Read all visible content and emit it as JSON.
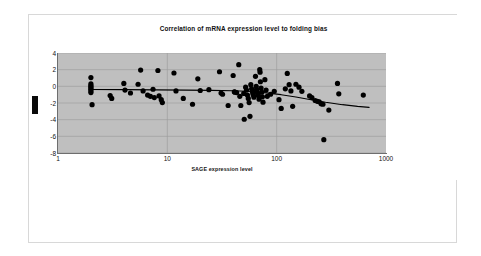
{
  "document": {
    "background_color": "#ffffff",
    "frame_color": "#d8d8d8"
  },
  "chart_data": {
    "type": "scatter",
    "title": "Correlation of mRNA expression level to folding bias",
    "xlabel": "SAGE expression level",
    "ylabel": "",
    "xscale": "log",
    "yscale": "linear",
    "xlim": [
      1,
      1000
    ],
    "ylim": [
      -8,
      4
    ],
    "xticks": [
      1,
      10,
      100,
      1000
    ],
    "xtick_labels": [
      "1",
      "10",
      "100",
      "1000"
    ],
    "yticks": [
      4,
      2,
      0,
      -2,
      -4,
      -6,
      -8
    ],
    "ytick_labels": [
      "4",
      "2",
      "0",
      "-2",
      "-4",
      "-6",
      "-8"
    ],
    "grid": true,
    "grid_color": "#9a9a9a",
    "plot_background": "#bfbfbf",
    "legend": null,
    "marker_color": "#000000",
    "marker_size": 2.6,
    "series": [
      {
        "name": "genes",
        "type": "scatter",
        "points": [
          [
            2.0,
            1.05
          ],
          [
            2.0,
            0.3
          ],
          [
            2.0,
            0.1
          ],
          [
            2.0,
            -0.05
          ],
          [
            2.0,
            -0.2
          ],
          [
            2.0,
            -0.35
          ],
          [
            2.0,
            -0.55
          ],
          [
            2.0,
            -0.75
          ],
          [
            2.05,
            -2.2
          ],
          [
            3.0,
            -1.1
          ],
          [
            3.1,
            -1.45
          ],
          [
            4.0,
            0.35
          ],
          [
            4.1,
            -0.45
          ],
          [
            4.6,
            -0.8
          ],
          [
            5.4,
            0.25
          ],
          [
            5.7,
            1.95
          ],
          [
            6.0,
            -0.55
          ],
          [
            6.6,
            -1.05
          ],
          [
            7.0,
            -1.2
          ],
          [
            7.4,
            -0.35
          ],
          [
            7.6,
            -1.35
          ],
          [
            8.2,
            1.9
          ],
          [
            8.4,
            -1.15
          ],
          [
            8.8,
            -1.6
          ],
          [
            9.0,
            -1.95
          ],
          [
            11.5,
            1.6
          ],
          [
            12.0,
            -0.55
          ],
          [
            14.0,
            -1.45
          ],
          [
            17.0,
            -2.15
          ],
          [
            19.0,
            0.9
          ],
          [
            20.0,
            -0.5
          ],
          [
            24.0,
            -0.4
          ],
          [
            30.0,
            1.75
          ],
          [
            31.0,
            -0.8
          ],
          [
            32.0,
            -0.95
          ],
          [
            36.0,
            -2.3
          ],
          [
            40.0,
            1.3
          ],
          [
            41.0,
            -0.65
          ],
          [
            41.5,
            -0.7
          ],
          [
            43.0,
            -0.75
          ],
          [
            45.0,
            2.6
          ],
          [
            46.0,
            -1.2
          ],
          [
            47.0,
            -2.3
          ],
          [
            50.0,
            -0.85
          ],
          [
            50.5,
            -3.95
          ],
          [
            52.0,
            -0.1
          ],
          [
            53.0,
            -0.45
          ],
          [
            54.0,
            -1.05
          ],
          [
            55.0,
            -1.45
          ],
          [
            56.0,
            -1.95
          ],
          [
            57.0,
            -3.6
          ],
          [
            58.0,
            0.2
          ],
          [
            59.0,
            -0.3
          ],
          [
            60.0,
            -0.6
          ],
          [
            60.5,
            -0.8
          ],
          [
            61.0,
            -1.0
          ],
          [
            62.0,
            -1.3
          ],
          [
            64.0,
            1.2
          ],
          [
            65.0,
            0.0
          ],
          [
            65.5,
            -0.35
          ],
          [
            66.0,
            -0.55
          ],
          [
            67.0,
            -0.85
          ],
          [
            68.0,
            -1.1
          ],
          [
            69.0,
            -1.55
          ],
          [
            70.0,
            2.0
          ],
          [
            70.5,
            1.7
          ],
          [
            71.0,
            0.55
          ],
          [
            72.0,
            -0.2
          ],
          [
            73.0,
            -0.7
          ],
          [
            74.0,
            -1.25
          ],
          [
            75.0,
            -1.9
          ],
          [
            78.0,
            0.8
          ],
          [
            80.0,
            -0.45
          ],
          [
            82.0,
            -1.2
          ],
          [
            88.0,
            -0.95
          ],
          [
            95.0,
            -0.6
          ],
          [
            105.0,
            -1.6
          ],
          [
            110.0,
            -2.65
          ],
          [
            120.0,
            -0.3
          ],
          [
            125.0,
            1.55
          ],
          [
            130.0,
            0.2
          ],
          [
            135.0,
            -0.55
          ],
          [
            140.0,
            -2.4
          ],
          [
            150.0,
            0.25
          ],
          [
            160.0,
            -0.1
          ],
          [
            170.0,
            -0.6
          ],
          [
            200.0,
            -1.15
          ],
          [
            210.0,
            -1.35
          ],
          [
            225.0,
            -1.7
          ],
          [
            235.0,
            -1.8
          ],
          [
            245.0,
            -1.85
          ],
          [
            255.0,
            -2.1
          ],
          [
            265.0,
            -2.15
          ],
          [
            270.0,
            -6.4
          ],
          [
            300.0,
            -2.85
          ],
          [
            360.0,
            0.35
          ],
          [
            370.0,
            -0.9
          ],
          [
            620.0,
            -1.05
          ]
        ]
      },
      {
        "name": "trend line",
        "type": "line",
        "color": "#000000",
        "points": [
          [
            2.0,
            -0.38
          ],
          [
            4.0,
            -0.4
          ],
          [
            8.0,
            -0.42
          ],
          [
            15.0,
            -0.45
          ],
          [
            25.0,
            -0.48
          ],
          [
            40.0,
            -0.53
          ],
          [
            60.0,
            -0.62
          ],
          [
            80.0,
            -0.78
          ],
          [
            110.0,
            -1.0
          ],
          [
            150.0,
            -1.28
          ],
          [
            200.0,
            -1.58
          ],
          [
            280.0,
            -1.92
          ],
          [
            400.0,
            -2.2
          ],
          [
            550.0,
            -2.4
          ],
          [
            700.0,
            -2.52
          ]
        ]
      }
    ],
    "annotations": [
      {
        "name": "left-marker",
        "shape": "filled-rectangle",
        "color": "#0a0a0a",
        "near_value": -2
      }
    ]
  }
}
